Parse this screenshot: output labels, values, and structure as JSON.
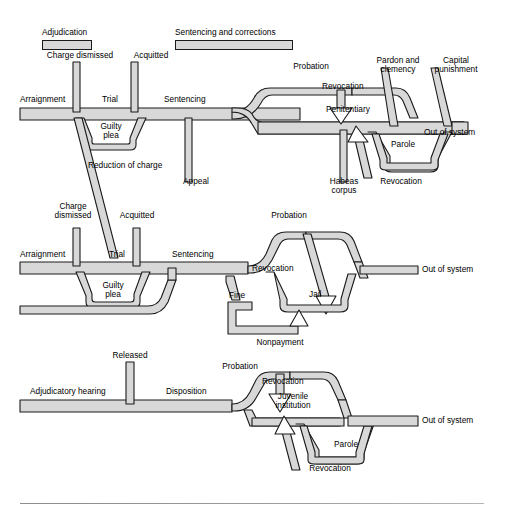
{
  "figure": {
    "type": "flowchart",
    "rows": 3,
    "pipe_fill": "#d8d8d8",
    "pipe_stroke": "#1a1a1a",
    "background": "#ffffff"
  },
  "legend": {
    "items": [
      {
        "label": "Adjudication",
        "bar_width": 48
      },
      {
        "label": "Sentencing and corrections",
        "bar_width": 116
      }
    ]
  },
  "row_felony": {
    "name": "felony-track",
    "labels": {
      "arraignment": "Arraignment",
      "charge_dismissed": "Charge dismissed",
      "trial": "Trial",
      "acquitted": "Acquitted",
      "guilty_plea": "Guilty\nplea",
      "guilty_plea_l1": "Guilty",
      "guilty_plea_l2": "plea",
      "sentencing": "Sentencing",
      "reduction_of_charge": "Reduction of charge",
      "appeal": "Appeal",
      "probation": "Probation",
      "revocation_top": "Revocation",
      "penitentiary": "Penitentiary",
      "pardon_and_clemency_l1": "Pardon and",
      "pardon_and_clemency_l2": "clemency",
      "capital_punishment_l1": "Capital",
      "capital_punishment_l2": "punishment",
      "habeas_corpus_l1": "Habeas",
      "habeas_corpus_l2": "corpus",
      "parole": "Parole",
      "revocation_parole": "Revocation",
      "out_of_system": "Out of system"
    }
  },
  "row_misdemeanor": {
    "name": "misdemeanor-track",
    "labels": {
      "arraignment": "Arraignment",
      "charge_dismissed_l1": "Charge",
      "charge_dismissed_l2": "dismissed",
      "trial": "Trial",
      "acquitted": "Acquitted",
      "guilty_plea_l1": "Guilty",
      "guilty_plea_l2": "plea",
      "sentencing": "Sentencing",
      "probation": "Probation",
      "revocation": "Revocation",
      "jail": "Jail",
      "fine": "Fine",
      "nonpayment": "Nonpayment",
      "out_of_system": "Out of system"
    }
  },
  "row_juvenile": {
    "name": "juvenile-track",
    "labels": {
      "adjudicatory_hearing": "Adjudicatory hearing",
      "released": "Released",
      "disposition": "Disposition",
      "probation": "Probation",
      "revocation_top": "Revocation",
      "juvenile_institution_l1": "Juvenile",
      "juvenile_institution_l2": "institution",
      "parole": "Parole",
      "revocation_parole": "Revocation",
      "out_of_system": "Out of system"
    }
  }
}
